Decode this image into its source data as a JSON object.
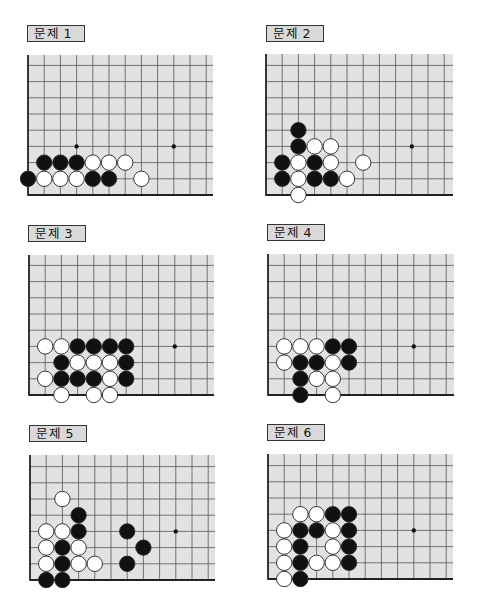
{
  "style": {
    "board_fill": "#e2e2e2",
    "grid_line": "#555555",
    "edge_line": "#222222",
    "black_stone": "#111111",
    "white_stone": "#ffffff",
    "stone_outline": "#222222",
    "label_fill": "#d9d9d9"
  },
  "spacing": 16.2,
  "problems": [
    {
      "label": "문제 1",
      "label_pos": [
        27,
        25
      ],
      "board": {
        "left": 28,
        "bottom": 195,
        "top": 55,
        "right": 213
      },
      "star_points": [
        [
          3,
          3
        ],
        [
          9,
          3
        ]
      ],
      "black": [
        [
          0,
          1
        ],
        [
          4,
          1
        ],
        [
          5,
          1
        ],
        [
          1,
          2
        ],
        [
          2,
          2
        ],
        [
          3,
          2
        ]
      ],
      "white": [
        [
          1,
          1
        ],
        [
          2,
          1
        ],
        [
          3,
          1
        ],
        [
          7,
          1
        ],
        [
          4,
          2
        ],
        [
          5,
          2
        ],
        [
          6,
          2
        ]
      ]
    },
    {
      "label": "문제 2",
      "label_pos": [
        266,
        25
      ],
      "board": {
        "left": 266,
        "bottom": 195,
        "top": 54,
        "right": 453
      },
      "star_points": [
        [
          9,
          3
        ]
      ],
      "black": [
        [
          1,
          1
        ],
        [
          3,
          1
        ],
        [
          4,
          1
        ],
        [
          1,
          2
        ],
        [
          3,
          2
        ],
        [
          2,
          3
        ],
        [
          2,
          4
        ]
      ],
      "white": [
        [
          2,
          0
        ],
        [
          2,
          1
        ],
        [
          5,
          1
        ],
        [
          2,
          2
        ],
        [
          4,
          2
        ],
        [
          6,
          2
        ],
        [
          3,
          3
        ],
        [
          4,
          3
        ]
      ]
    },
    {
      "label": "문제 3",
      "label_pos": [
        28,
        225
      ],
      "board": {
        "left": 29,
        "bottom": 395,
        "top": 255,
        "right": 214
      },
      "star_points": [
        [
          9,
          3
        ]
      ],
      "black": [
        [
          2,
          1
        ],
        [
          3,
          1
        ],
        [
          4,
          1
        ],
        [
          6,
          1
        ],
        [
          2,
          2
        ],
        [
          6,
          2
        ],
        [
          3,
          3
        ],
        [
          4,
          3
        ],
        [
          5,
          3
        ],
        [
          6,
          3
        ]
      ],
      "white": [
        [
          2,
          0
        ],
        [
          4,
          0
        ],
        [
          5,
          0
        ],
        [
          1,
          1
        ],
        [
          5,
          1
        ],
        [
          3,
          2
        ],
        [
          4,
          2
        ],
        [
          5,
          2
        ],
        [
          1,
          3
        ],
        [
          2,
          3
        ]
      ]
    },
    {
      "label": "문제 4",
      "label_pos": [
        267,
        224
      ],
      "board": {
        "left": 268,
        "bottom": 395,
        "top": 254,
        "right": 454
      },
      "star_points": [
        [
          9,
          3
        ]
      ],
      "black": [
        [
          2,
          0
        ],
        [
          2,
          1
        ],
        [
          2,
          2
        ],
        [
          3,
          2
        ],
        [
          5,
          2
        ],
        [
          4,
          3
        ],
        [
          5,
          3
        ]
      ],
      "white": [
        [
          4,
          0
        ],
        [
          3,
          1
        ],
        [
          4,
          1
        ],
        [
          1,
          2
        ],
        [
          4,
          2
        ],
        [
          1,
          3
        ],
        [
          2,
          3
        ],
        [
          3,
          3
        ]
      ]
    },
    {
      "label": "문제 5",
      "label_pos": [
        29,
        425
      ],
      "board": {
        "left": 30,
        "bottom": 580,
        "top": 455,
        "right": 215
      },
      "star_points": [
        [
          9,
          3
        ]
      ],
      "black": [
        [
          1,
          0
        ],
        [
          2,
          0
        ],
        [
          2,
          1
        ],
        [
          6,
          1
        ],
        [
          2,
          2
        ],
        [
          7,
          2
        ],
        [
          3,
          3
        ],
        [
          6,
          3
        ],
        [
          3,
          4
        ]
      ],
      "white": [
        [
          1,
          1
        ],
        [
          3,
          1
        ],
        [
          4,
          1
        ],
        [
          1,
          2
        ],
        [
          3,
          2
        ],
        [
          1,
          3
        ],
        [
          2,
          3
        ],
        [
          2,
          5
        ]
      ]
    },
    {
      "label": "문제 6",
      "label_pos": [
        267,
        424
      ],
      "board": {
        "left": 268,
        "bottom": 579,
        "top": 454,
        "right": 453
      },
      "star_points": [
        [
          9,
          3
        ]
      ],
      "black": [
        [
          2,
          0
        ],
        [
          2,
          1
        ],
        [
          5,
          1
        ],
        [
          2,
          2
        ],
        [
          5,
          2
        ],
        [
          2,
          3
        ],
        [
          3,
          3
        ],
        [
          5,
          3
        ],
        [
          4,
          4
        ],
        [
          5,
          4
        ]
      ],
      "white": [
        [
          1,
          0
        ],
        [
          1,
          1
        ],
        [
          3,
          1
        ],
        [
          4,
          1
        ],
        [
          1,
          2
        ],
        [
          4,
          2
        ],
        [
          1,
          3
        ],
        [
          4,
          3
        ],
        [
          2,
          4
        ],
        [
          3,
          4
        ]
      ]
    }
  ]
}
